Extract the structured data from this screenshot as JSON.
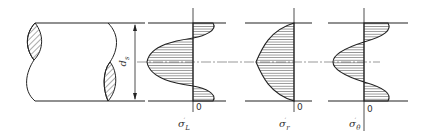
{
  "figure": {
    "colors": {
      "line": "#222222",
      "hatch": "#444444",
      "centerline": "#555555",
      "background": "#ffffff"
    }
  },
  "shaft": {
    "dimension_label": "d",
    "dimension_subscript": "s"
  },
  "panels": [
    {
      "id": "longitudinal",
      "symbol": "σ",
      "subscript": "L",
      "superscript": "′",
      "zero_label": "0"
    },
    {
      "id": "radial",
      "symbol": "σ",
      "subscript": "r",
      "superscript": "′",
      "zero_label": "0"
    },
    {
      "id": "tangential",
      "symbol": "σ",
      "subscript": "θ",
      "superscript": "′",
      "zero_label": "0"
    }
  ]
}
